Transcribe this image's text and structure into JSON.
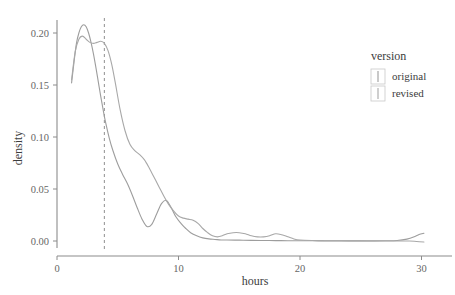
{
  "chart_data": {
    "type": "line",
    "title": "",
    "xlabel": "hours",
    "ylabel": "density",
    "xlim": [
      0,
      31
    ],
    "ylim": [
      -0.006,
      0.218
    ],
    "xticks": [
      0,
      10,
      20,
      30
    ],
    "xticklabels": [
      "0",
      "10",
      "20",
      "30"
    ],
    "yticks": [
      0.0,
      0.05,
      0.1,
      0.15,
      0.2
    ],
    "yticklabels": [
      "0.00",
      "0.05",
      "0.10",
      "0.15",
      "0.20"
    ],
    "grid": false,
    "legend": {
      "title": "version",
      "position": "right",
      "entries": [
        {
          "label": "original",
          "color": "#9d9d9d"
        },
        {
          "label": "revised",
          "color": "#a8a8a8"
        }
      ]
    },
    "annotations": [
      {
        "type": "vline",
        "x": 3.9,
        "style": "dashed",
        "color": "#9a9a9a"
      }
    ],
    "series": [
      {
        "name": "original",
        "color": "#9d9d9d",
        "x": [
          1.2,
          1.4,
          1.6,
          1.8,
          2.0,
          2.2,
          2.4,
          2.6,
          2.8,
          3.0,
          3.2,
          3.4,
          3.6,
          3.8,
          4.0,
          4.3,
          4.6,
          5.0,
          5.4,
          5.8,
          6.2,
          6.6,
          7.0,
          7.4,
          7.8,
          8.2,
          8.6,
          9.0,
          9.4,
          9.8,
          10.2,
          10.6,
          11.0,
          11.5,
          12.0,
          12.5,
          13.0,
          13.5,
          14.0,
          15.0,
          16.0,
          17.0,
          18.0,
          19.0,
          20.0,
          21.0,
          22.0,
          23.0,
          24.0,
          25.0,
          26.0,
          27.0,
          28.0,
          28.8,
          29.4,
          29.8,
          30.2
        ],
        "y": [
          0.152,
          0.172,
          0.19,
          0.2,
          0.206,
          0.208,
          0.206,
          0.2,
          0.191,
          0.18,
          0.167,
          0.153,
          0.139,
          0.126,
          0.114,
          0.099,
          0.087,
          0.074,
          0.064,
          0.055,
          0.044,
          0.032,
          0.021,
          0.014,
          0.016,
          0.026,
          0.036,
          0.039,
          0.032,
          0.023,
          0.017,
          0.012,
          0.008,
          0.005,
          0.003,
          0.002,
          0.0015,
          0.001,
          0.001,
          0.0008,
          0.0006,
          0.0005,
          0.0004,
          0.0003,
          0.0002,
          0.0002,
          0.0001,
          0.0001,
          0.0001,
          0.0001,
          0.0001,
          0.0002,
          0.0005,
          0.0018,
          0.004,
          0.0062,
          0.0075
        ]
      },
      {
        "name": "revised",
        "color": "#a8a8a8",
        "x": [
          1.2,
          1.5,
          1.8,
          2.1,
          2.4,
          2.7,
          3.0,
          3.3,
          3.6,
          3.9,
          4.2,
          4.5,
          4.8,
          5.2,
          5.6,
          6.0,
          6.4,
          6.8,
          7.2,
          7.6,
          8.0,
          8.4,
          8.8,
          9.2,
          9.6,
          10.0,
          10.4,
          10.8,
          11.2,
          11.6,
          12.0,
          12.4,
          12.8,
          13.2,
          13.6,
          14.0,
          14.5,
          15.0,
          15.5,
          16.0,
          16.5,
          17.0,
          17.5,
          18.0,
          18.5,
          19.0,
          19.5,
          20.0,
          21.0,
          22.0,
          23.0,
          24.0,
          25.0,
          26.0,
          27.0,
          28.0,
          29.0,
          29.6,
          30.2
        ],
        "y": [
          0.155,
          0.182,
          0.194,
          0.197,
          0.194,
          0.191,
          0.19,
          0.191,
          0.192,
          0.19,
          0.183,
          0.17,
          0.152,
          0.126,
          0.106,
          0.093,
          0.087,
          0.083,
          0.078,
          0.07,
          0.061,
          0.052,
          0.043,
          0.035,
          0.029,
          0.024,
          0.022,
          0.021,
          0.02,
          0.017,
          0.012,
          0.008,
          0.005,
          0.004,
          0.005,
          0.007,
          0.008,
          0.008,
          0.007,
          0.005,
          0.004,
          0.004,
          0.005,
          0.007,
          0.006,
          0.004,
          0.002,
          0.001,
          0.0005,
          0.0003,
          0.0002,
          0.0001,
          0.0001,
          0.0,
          0.0,
          0.0,
          0.0,
          -0.0005,
          -0.001
        ]
      }
    ]
  },
  "axes": {
    "x_title": "hours",
    "y_title": "density"
  }
}
